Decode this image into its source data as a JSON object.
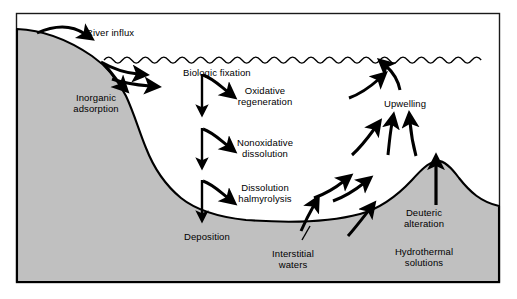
{
  "figure": {
    "frame": {
      "x": 16,
      "y": 13,
      "width": 484,
      "height": 270,
      "border_color": "#1a1a1a"
    },
    "colors": {
      "sediment_fill": "#c0c0c0",
      "water_fill": "#ffffff",
      "outline": "#000000",
      "arrow": "#000000",
      "page_background": "#ffffff"
    }
  },
  "labels": [
    {
      "id": "river-influx",
      "text": "River influx",
      "x": 86,
      "y": 27,
      "align": "left"
    },
    {
      "id": "inorganic-adsorption",
      "text": "Inorganic\nadsorption",
      "x": 96,
      "y": 92,
      "align": "center"
    },
    {
      "id": "biologic-fixation",
      "text": "Biologic fixation",
      "x": 183,
      "y": 67,
      "align": "left"
    },
    {
      "id": "oxidative-regeneration",
      "text": "Oxidative\nregeneration",
      "x": 265,
      "y": 85,
      "align": "center"
    },
    {
      "id": "nonoxidative-dissolution",
      "text": "Nonoxidative\ndissolution",
      "x": 265,
      "y": 137,
      "align": "center"
    },
    {
      "id": "dissolution-halmyrolysis",
      "text": "Dissolution\nhalmyrolysis",
      "x": 265,
      "y": 182,
      "align": "center"
    },
    {
      "id": "deposition",
      "text": "Deposition",
      "x": 184,
      "y": 231,
      "align": "left"
    },
    {
      "id": "interstitial-waters",
      "text": "Interstitial\nwaters",
      "x": 293,
      "y": 248,
      "align": "center"
    },
    {
      "id": "upwelling",
      "text": "Upwelling",
      "x": 384,
      "y": 98,
      "align": "left"
    },
    {
      "id": "deuteric-alteration",
      "text": "Deuteric\nalteration",
      "x": 424,
      "y": 207,
      "align": "center"
    },
    {
      "id": "hydrothermal-solutions",
      "text": "Hydrothermal\nsolutions",
      "x": 424,
      "y": 246,
      "align": "center"
    }
  ],
  "processes": [
    "River influx",
    "Inorganic adsorption",
    "Biologic fixation",
    "Oxidative regeneration",
    "Nonoxidative dissolution",
    "Dissolution halmyrolysis",
    "Deposition",
    "Interstitial waters",
    "Upwelling",
    "Deuteric alteration",
    "Hydrothermal solutions"
  ]
}
